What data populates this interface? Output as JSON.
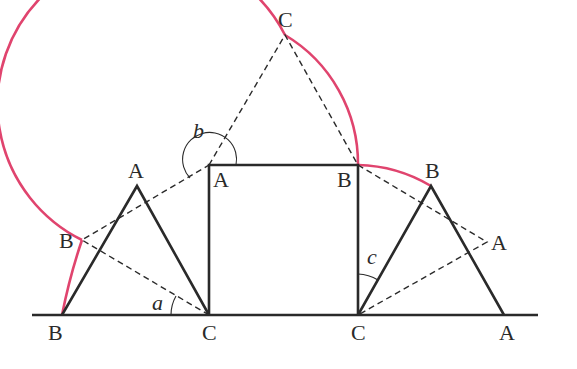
{
  "diagram": {
    "colors": {
      "locus": "#e0446e",
      "lines": "#2a2a2a",
      "background": "#ffffff"
    },
    "labels": {
      "top_C": "C",
      "square_A": "A",
      "square_B": "B",
      "left_tri_apex_A": "A",
      "right_tri_apex_B": "B",
      "left_mid_B": "B",
      "right_mid_A": "A",
      "base_B": "B",
      "base_left_C": "C",
      "base_right_C": "C",
      "base_A": "A",
      "angle_a": "a",
      "angle_b": "b",
      "angle_c": "c"
    },
    "points": {
      "base_B": [
        62,
        315
      ],
      "base_left_C": [
        209,
        315
      ],
      "base_right_C": [
        358,
        315
      ],
      "base_A": [
        504,
        315
      ],
      "square_A": [
        209,
        165
      ],
      "square_B": [
        358,
        165
      ],
      "left_apex_A": [
        137,
        186
      ],
      "right_apex_B": [
        431,
        186
      ],
      "left_mid_B": [
        82,
        240
      ],
      "right_mid_A": [
        487,
        242
      ],
      "top_C": [
        285,
        35
      ]
    }
  }
}
